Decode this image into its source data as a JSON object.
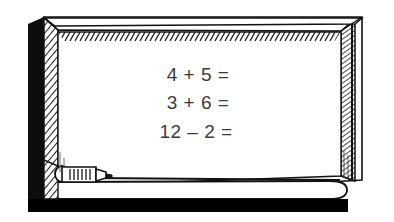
{
  "illustration": {
    "title": "Whiteboard with arithmetic problems",
    "subject": "classroom-whiteboard",
    "style": "black-and-white line drawing with hatching"
  },
  "board": {
    "surface_label": "whiteboard writing surface",
    "surface_color": "#ffffff",
    "frame_color": "#ffffff",
    "frame_hatch_color": "#1a1a1a",
    "outer_shadow_color": "#0d0d0d",
    "ink_color": "#3b3b3b"
  },
  "equations": [
    {
      "line": 1,
      "text": "4  +  5  =",
      "left_operand": "4",
      "operator": "+",
      "right_operand": "5",
      "equals": "=",
      "answer": ""
    },
    {
      "line": 2,
      "text": "3  +  6  =",
      "left_operand": "3",
      "operator": "+",
      "right_operand": "6",
      "equals": "=",
      "answer": ""
    },
    {
      "line": 3,
      "text": "12  –  2  =",
      "left_operand": "12",
      "operator": "–",
      "right_operand": "2",
      "equals": "=",
      "answer": ""
    }
  ],
  "tray": {
    "label": "marker tray ledge",
    "color": "#ffffff",
    "shadow_color": "#000000"
  },
  "marker": {
    "label": "dry-erase marker",
    "body_color": "#ffffff",
    "outline_color": "#111111",
    "position": "resting on left end of tray"
  }
}
